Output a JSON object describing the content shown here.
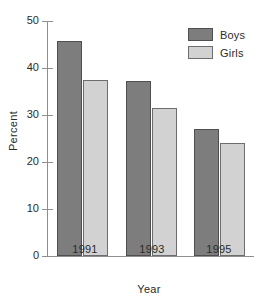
{
  "chart_data": {
    "type": "bar",
    "title": "",
    "xlabel": "Year",
    "ylabel": "Percent",
    "categories": [
      "1991",
      "1993",
      "1995"
    ],
    "series": [
      {
        "name": "Boys",
        "values": [
          45.8,
          37.2,
          27.0
        ],
        "color": "#7d7d7d"
      },
      {
        "name": "Girls",
        "values": [
          37.5,
          31.5,
          24.0
        ],
        "color": "#d2d2d2"
      }
    ],
    "ylim": [
      0,
      50
    ],
    "yticks": [
      0,
      10,
      20,
      30,
      40,
      50
    ],
    "ytick_labels": [
      "0",
      "10",
      "20",
      "30",
      "40",
      "50"
    ],
    "grid": false,
    "legend_position": "top-right"
  },
  "legend": {
    "entries": [
      {
        "label": "Boys"
      },
      {
        "label": "Girls"
      }
    ]
  },
  "axes": {
    "y_title": "Percent",
    "x_title": "Year",
    "y_tick_0": "0",
    "y_tick_1": "10",
    "y_tick_2": "20",
    "y_tick_3": "30",
    "y_tick_4": "40",
    "y_tick_5": "50"
  },
  "categories": {
    "c0": "1991",
    "c1": "1993",
    "c2": "1995"
  }
}
